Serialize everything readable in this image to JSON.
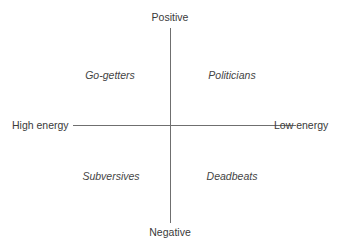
{
  "diagram": {
    "axes": {
      "vertical": {
        "top_label": "Positive",
        "bottom_label": "Negative"
      },
      "horizontal": {
        "left_label": "High energy",
        "right_label": "Low energy"
      }
    },
    "quadrants": {
      "top_left": "Go-getters",
      "top_right": "Politicians",
      "bottom_left": "Subversives",
      "bottom_right": "Deadbeats"
    },
    "colors": {
      "line": "#6f6f6f",
      "text": "#3a3a3a",
      "background": "#ffffff"
    }
  }
}
